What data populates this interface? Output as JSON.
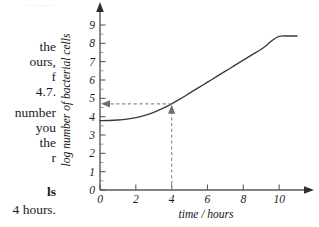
{
  "page": {
    "faint_top_fragment": "·········",
    "body_text_lines": [
      {
        "text": "the",
        "bold": false,
        "top": 40
      },
      {
        "text": "ours,",
        "bold": false,
        "top": 55
      },
      {
        "text": "f",
        "bold": false,
        "top": 70
      },
      {
        "text": "4.7.",
        "bold": false,
        "top": 85
      },
      {
        "text": "number",
        "bold": false,
        "top": 106
      },
      {
        "text": "you",
        "bold": false,
        "top": 121
      },
      {
        "text": "the",
        "bold": false,
        "top": 136
      },
      {
        "text": "r",
        "bold": false,
        "top": 151
      },
      {
        "text": "ls",
        "bold": true,
        "top": 185
      },
      {
        "text": "4 hours.",
        "bold": false,
        "top": 203
      }
    ]
  },
  "chart_data": {
    "type": "line",
    "title": "",
    "xlabel": "time / hours",
    "ylabel": "log number of bacterial cells",
    "xlim": [
      0,
      11.5
    ],
    "ylim": [
      0,
      9.6
    ],
    "xticks": [
      0,
      2,
      4,
      6,
      8,
      10
    ],
    "xtick_labels": [
      "0",
      "2",
      "4",
      "6",
      "8",
      "10"
    ],
    "yticks": [
      0,
      1,
      2,
      3,
      4,
      5,
      6,
      7,
      8,
      9
    ],
    "ytick_labels": [
      "0",
      "1",
      "2",
      "3",
      "4",
      "5",
      "6",
      "7",
      "8",
      "9"
    ],
    "grid": false,
    "legend": null,
    "series": [
      {
        "name": "bacterial growth curve",
        "x": [
          0.0,
          0.5,
          1.0,
          1.5,
          2.0,
          2.5,
          3.0,
          3.5,
          4.0,
          4.5,
          5.0,
          5.5,
          6.0,
          6.5,
          7.0,
          7.5,
          8.0,
          8.5,
          9.0,
          9.3,
          9.6,
          10.0,
          10.5,
          11.0
        ],
        "y": [
          3.78,
          3.79,
          3.82,
          3.87,
          3.95,
          4.07,
          4.24,
          4.45,
          4.7,
          4.98,
          5.28,
          5.58,
          5.88,
          6.18,
          6.48,
          6.78,
          7.08,
          7.38,
          7.68,
          7.9,
          8.15,
          8.38,
          8.4,
          8.4
        ]
      }
    ],
    "annotations": {
      "reading_x": 4,
      "reading_y": 4.7,
      "horizontal_guide": {
        "from_x": 4,
        "to_x": 0,
        "y": 4.7,
        "arrow": "left"
      },
      "vertical_guide": {
        "x": 4,
        "from_y": 0,
        "to_y": 4.7,
        "arrow": "up"
      }
    }
  }
}
